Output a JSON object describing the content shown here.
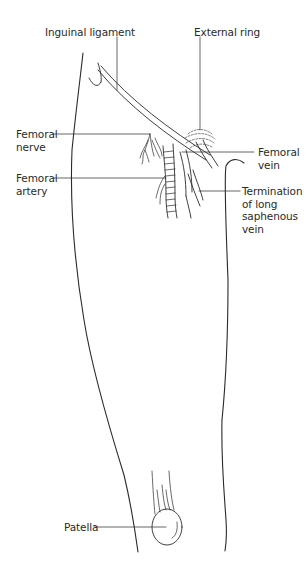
{
  "diagram": {
    "style": "black line drawing on white background",
    "line_color": "#2a2a2a",
    "background_color": "#ffffff",
    "labels": [
      {
        "id": "inguinal_ligament",
        "text": "Inguinal ligament"
      },
      {
        "id": "external_ring",
        "text": "External ring"
      },
      {
        "id": "femoral_nerve",
        "text": "Femoral\nnerve"
      },
      {
        "id": "femoral_vein",
        "text": "Femoral\nvein"
      },
      {
        "id": "femoral_artery",
        "text": "Femoral\nartery"
      },
      {
        "id": "termination_lsv",
        "text": "Termination\nof long\nsaphenous\nvein"
      },
      {
        "id": "patella",
        "text": "Patella"
      }
    ],
    "structures": [
      "thigh-outline-lateral",
      "thigh-outline-medial",
      "inguinal-ligament",
      "anterior-superior-iliac-spine",
      "external-inguinal-ring",
      "femoral-nerve-branches",
      "femoral-artery",
      "femoral-vein",
      "long-saphenous-vein",
      "patella",
      "quadriceps-tendon"
    ]
  }
}
